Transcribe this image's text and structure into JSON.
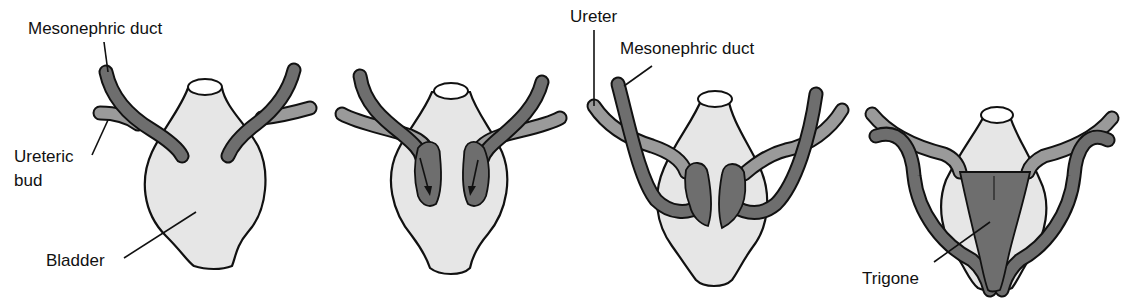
{
  "figure": {
    "stages": [
      {
        "id": "stage-1",
        "labels": {
          "mesonephric_duct": "Mesonephric duct",
          "ureteric_bud_line1": "Ureteric",
          "ureteric_bud_line2": "bud",
          "bladder": "Bladder"
        }
      },
      {
        "id": "stage-2",
        "labels": {}
      },
      {
        "id": "stage-3",
        "labels": {
          "ureter": "Ureter",
          "mesonephric_duct": "Mesonephric duct"
        }
      },
      {
        "id": "stage-4",
        "labels": {
          "trigone": "Trigone"
        }
      }
    ],
    "colors": {
      "bladder_fill": "#e6e6e6",
      "mesonephric_duct": "#6e6e6e",
      "ureteric_bud": "#9a9a9a",
      "outline": "#111111"
    }
  }
}
